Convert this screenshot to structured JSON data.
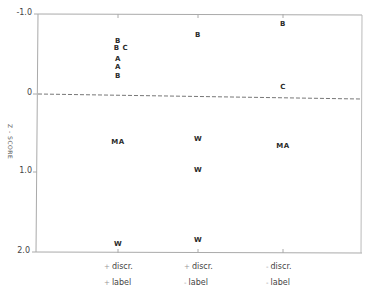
{
  "chart_data": {
    "type": "scatter",
    "title": "",
    "xlabel": "",
    "ylabel": "Z - SCORE",
    "y_inverted": true,
    "ylim": [
      -1.0,
      2.0
    ],
    "yticks": [
      "-1.0",
      "0",
      "1.0",
      "2.0"
    ],
    "reference_line": {
      "y": 0,
      "style": "dashed"
    },
    "grid": false,
    "categories": [
      {
        "line1": "discr.",
        "sign1": "+",
        "line2": "label",
        "sign2": "+"
      },
      {
        "line1": "discr.",
        "sign1": "+",
        "line2": "label",
        "sign2": "-"
      },
      {
        "line1": "discr.",
        "sign1": "-",
        "line2": "label",
        "sign2": "-"
      }
    ],
    "points": [
      {
        "category": 0,
        "label": "B",
        "y": -0.66
      },
      {
        "category": 0,
        "label": "B C",
        "y": -0.57
      },
      {
        "category": 0,
        "label": "A",
        "y": -0.43
      },
      {
        "category": 0,
        "label": "A",
        "y": -0.33
      },
      {
        "category": 0,
        "label": "B",
        "y": -0.22
      },
      {
        "category": 0,
        "label": "MA",
        "y": 0.62
      },
      {
        "category": 0,
        "label": "W",
        "y": 1.9
      },
      {
        "category": 1,
        "label": "B",
        "y": -0.73
      },
      {
        "category": 1,
        "label": "W",
        "y": 0.57
      },
      {
        "category": 1,
        "label": "W",
        "y": 0.97
      },
      {
        "category": 1,
        "label": "W",
        "y": 1.85
      },
      {
        "category": 2,
        "label": "B",
        "y": -0.87
      },
      {
        "category": 2,
        "label": "C",
        "y": -0.08
      },
      {
        "category": 2,
        "label": "MA",
        "y": 0.67
      }
    ]
  },
  "colors": {
    "axis": "#9a9a9a",
    "text": "#2b2b2b",
    "dashed": "#777777"
  }
}
